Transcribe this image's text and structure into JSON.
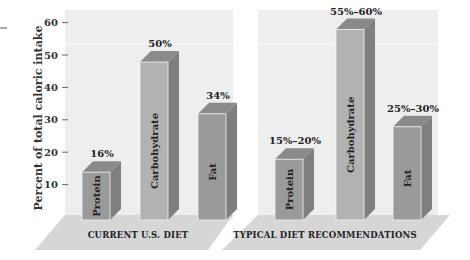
{
  "chart_data": {
    "type": "bar",
    "title": "",
    "ylabel": "Percent of total caloric intake",
    "xlabel": "",
    "ylim": [
      0,
      60
    ],
    "yticks": [
      10,
      20,
      30,
      40,
      50,
      60
    ],
    "grid": false,
    "style": "3d-bar",
    "colors": {
      "panel_bg": "#eeeeee",
      "floor": "#d6d6d6",
      "bar_front": "#9a9a9a",
      "bar_front_light": "#b2b2b2",
      "bar_side": "#7f7f7f",
      "bar_top": "#8a8a8a"
    },
    "panels": [
      {
        "name": "CURRENT U.S. DIET",
        "categories": [
          "Protein",
          "Carbohydrate",
          "Fat"
        ],
        "values": [
          16,
          50,
          34
        ],
        "labels": [
          "16%",
          "50%",
          "34%"
        ]
      },
      {
        "name": "TYPICAL DIET RECOMMENDATIONS",
        "categories": [
          "Protein",
          "Carbohydrate",
          "Fat"
        ],
        "values": [
          [
            15,
            20
          ],
          [
            55,
            60
          ],
          [
            25,
            30
          ]
        ],
        "labels": [
          "15%–20%",
          "55%–60%",
          "25%–30%"
        ]
      }
    ]
  }
}
